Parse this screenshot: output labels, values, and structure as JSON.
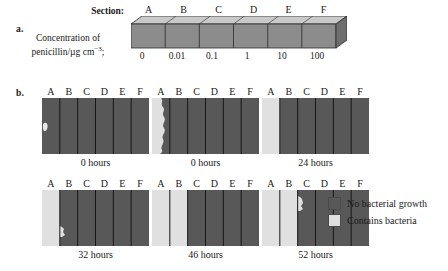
{
  "figure": {
    "part_a": {
      "label": "a.",
      "section_caption": "Section:",
      "concentration_caption_line1": "Concentration of",
      "concentration_caption_line2_prefix": "penicillin/µg cm",
      "concentration_caption_line2_sup": "−3",
      "concentration_caption_line2_suffix": ";",
      "sections": [
        "A",
        "B",
        "C",
        "D",
        "E",
        "F"
      ],
      "concentrations": [
        "0",
        "0.01",
        "0.1",
        "1",
        "10",
        "100"
      ]
    },
    "part_b": {
      "label": "b.",
      "section_letters": [
        "A",
        "B",
        "C",
        "D",
        "E",
        "F"
      ],
      "panels": [
        {
          "caption": "0 hours",
          "growth_pattern": "tiny-spot-left-edge-of-A"
        },
        {
          "caption": "0 hours",
          "growth_pattern": "section-A-wavy-edge"
        },
        {
          "caption": "24 hours",
          "growth_pattern": "section-A-full"
        },
        {
          "caption": "32 hours",
          "growth_pattern": "section-A-full-with-small-bulge-into-B"
        },
        {
          "caption": "46 hours",
          "growth_pattern": "sections-A-and-B-full"
        },
        {
          "caption": "52 hours",
          "growth_pattern": "sections-A-and-B-full-with-bulge-into-C"
        }
      ]
    },
    "legend": {
      "items": [
        {
          "label": "No bacterial growth",
          "swatch": "dark"
        },
        {
          "label": "Contains bacteria",
          "swatch": "light"
        }
      ]
    },
    "colors": {
      "no_growth": "#585858",
      "contains_bacteria": "#dedede",
      "bar_front": "#8c8c8c",
      "bar_top": "#c9c9c9",
      "bar_side": "#6e6e6e",
      "outline": "#2b2b2b",
      "text": "#1a1a1a"
    }
  }
}
